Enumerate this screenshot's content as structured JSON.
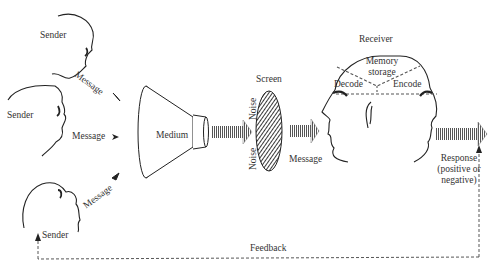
{
  "diagram": {
    "senders": [
      {
        "label": "Sender",
        "message_label": "Message"
      },
      {
        "label": "Sender",
        "message_label": "Message"
      },
      {
        "label": "Sender",
        "message_label": "Message"
      }
    ],
    "medium": {
      "label": "Medium"
    },
    "screen": {
      "label": "Screen",
      "noise_top": "Noise",
      "noise_bottom": "Noise"
    },
    "screen_output": {
      "message_label": "Message"
    },
    "receiver": {
      "label": "Receiver",
      "memory_line1": "Memory",
      "memory_line2": "storage",
      "decode": "Decode",
      "encode": "Encode"
    },
    "response": {
      "line1": "Response",
      "line2": "(positive or",
      "line3": "negative)"
    },
    "feedback": {
      "label": "Feedback"
    }
  }
}
